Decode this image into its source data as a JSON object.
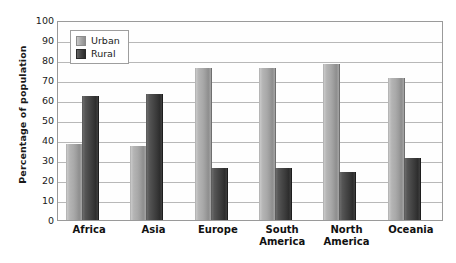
{
  "chart_data": {
    "type": "bar",
    "title": "",
    "xlabel": "",
    "ylabel": "Percentage of population",
    "ylim": [
      0,
      100
    ],
    "ytick_step": 10,
    "yticks": [
      100,
      90,
      80,
      70,
      60,
      50,
      40,
      30,
      20,
      10,
      0
    ],
    "grid": "horizontal",
    "legend_position": "top-left-inside",
    "categories": [
      "Africa",
      "Asia",
      "Europe",
      "South America",
      "North America",
      "Oceania"
    ],
    "series": [
      {
        "name": "Urban",
        "color": "#a8a8a8",
        "values": [
          38,
          37,
          76,
          76,
          78,
          71
        ]
      },
      {
        "name": "Rural",
        "color": "#3a3a3a",
        "values": [
          62,
          63,
          26,
          26,
          24,
          31
        ]
      }
    ]
  },
  "legend": {
    "items": [
      {
        "label": "Urban",
        "swatch": "urban"
      },
      {
        "label": "Rural",
        "swatch": "rural"
      }
    ]
  },
  "axes": {
    "y_title": "Percentage of population",
    "y_ticks": [
      "100",
      "90",
      "80",
      "70",
      "60",
      "50",
      "40",
      "30",
      "20",
      "10",
      "0"
    ],
    "x_labels": [
      {
        "line1": "Africa",
        "line2": ""
      },
      {
        "line1": "Asia",
        "line2": ""
      },
      {
        "line1": "Europe",
        "line2": ""
      },
      {
        "line1": "South",
        "line2": "America"
      },
      {
        "line1": "North",
        "line2": "America"
      },
      {
        "line1": "Oceania",
        "line2": ""
      }
    ]
  },
  "colors": {
    "urban": "#a8a8a8",
    "rural": "#3a3a3a",
    "gridline": "#b8b8b8",
    "frame": "#9a9a9a",
    "text": "#1a1a1a",
    "background": "#ffffff"
  }
}
